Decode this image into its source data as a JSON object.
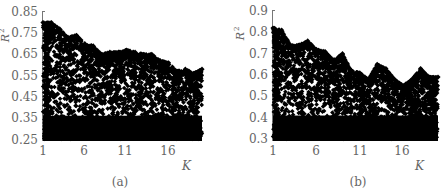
{
  "chart_data": [
    {
      "type": "scatter",
      "panel_label": "(a)",
      "xlabel": "K",
      "ylabel": "R2",
      "xticks": [
        "1",
        "6",
        "11",
        "16"
      ],
      "yticks": [
        "0.85",
        "0.75",
        "0.65",
        "0.55",
        "0.45",
        "0.35",
        "0.25"
      ],
      "xlim": [
        1,
        20
      ],
      "ylim": [
        0.25,
        0.85
      ],
      "upper_envelope": {
        "x": [
          1,
          2,
          3,
          4,
          5,
          6,
          7,
          8,
          9,
          10,
          11,
          12,
          13,
          14,
          15,
          16,
          17,
          18,
          19,
          20
        ],
        "y": [
          0.8,
          0.8,
          0.77,
          0.73,
          0.74,
          0.7,
          0.69,
          0.65,
          0.66,
          0.66,
          0.67,
          0.66,
          0.65,
          0.65,
          0.62,
          0.61,
          0.57,
          0.58,
          0.56,
          0.58
        ]
      },
      "dense_region_top": 0.4,
      "marker": "diamond",
      "color": "#000000"
    },
    {
      "type": "scatter",
      "panel_label": "(b)",
      "xlabel": "K",
      "ylabel": "R2",
      "xticks": [
        "1",
        "6",
        "11",
        "16"
      ],
      "yticks": [
        "0.9",
        "0.8",
        "0.7",
        "0.6",
        "0.5",
        "0.4",
        "0.3"
      ],
      "xlim": [
        1,
        20
      ],
      "ylim": [
        0.3,
        0.9
      ],
      "upper_envelope": {
        "x": [
          1,
          2,
          3,
          4,
          5,
          6,
          7,
          8,
          9,
          10,
          11,
          12,
          13,
          14,
          15,
          16,
          17,
          18,
          19,
          20
        ],
        "y": [
          0.82,
          0.81,
          0.74,
          0.74,
          0.76,
          0.72,
          0.71,
          0.67,
          0.7,
          0.62,
          0.61,
          0.58,
          0.65,
          0.63,
          0.58,
          0.55,
          0.58,
          0.63,
          0.59,
          0.59
        ]
      },
      "dense_region_top": 0.45,
      "marker": "diamond",
      "color": "#000000"
    }
  ]
}
